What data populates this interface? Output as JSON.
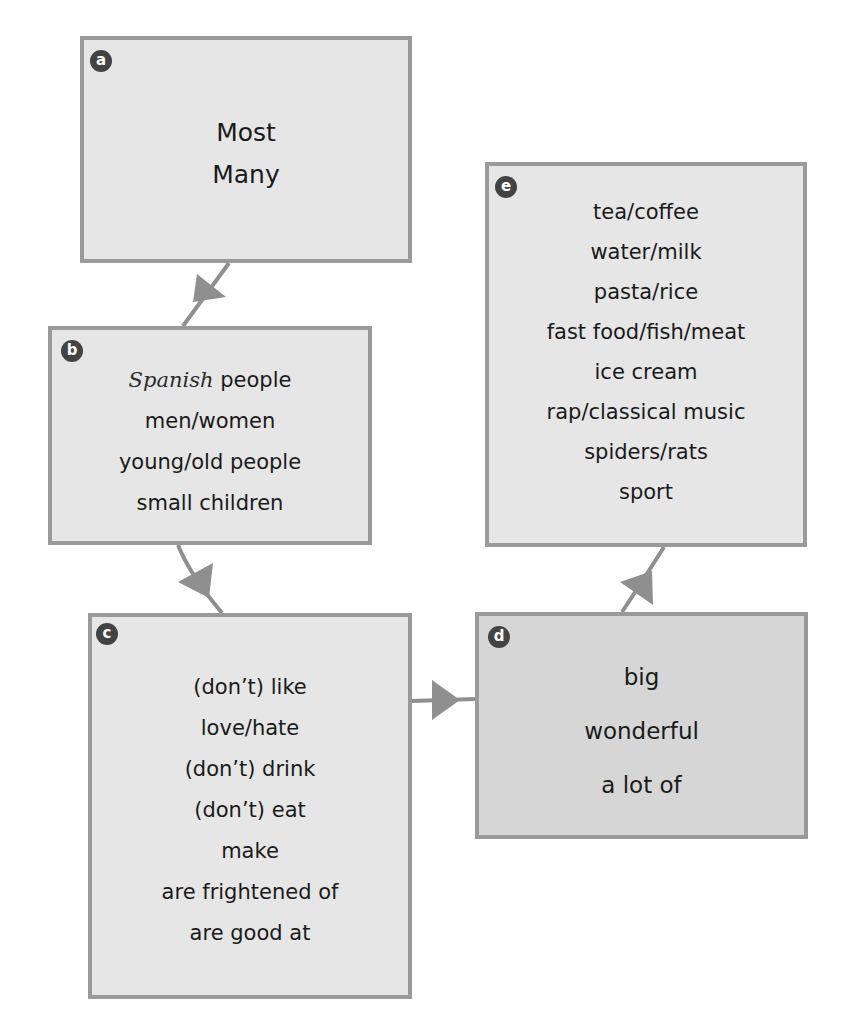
{
  "diagram": {
    "type": "flow",
    "colors": {
      "box_fill": "#e6e6e6",
      "box_fill_d": "#d6d6d6",
      "box_border": "#9a9a9a",
      "badge": "#434343",
      "arrow": "#8f8f8f"
    },
    "boxes": [
      {
        "id": "a",
        "label": "a",
        "lines": [
          "Most",
          "Many"
        ]
      },
      {
        "id": "b",
        "label": "b",
        "handwritten": "Spanish",
        "lines": [
          "people",
          "men/women",
          "young/old people",
          "small children"
        ]
      },
      {
        "id": "c",
        "label": "c",
        "lines": [
          "(don’t) like",
          "love/hate",
          "(don’t) drink",
          "(don’t) eat",
          "make",
          "are frightened of",
          "are good at"
        ]
      },
      {
        "id": "d",
        "label": "d",
        "lines": [
          "big",
          "wonderful",
          "a lot of"
        ]
      },
      {
        "id": "e",
        "label": "e",
        "lines": [
          "tea/coffee",
          "water/milk",
          "pasta/rice",
          "fast food/fish/meat",
          "ice cream",
          "rap/classical music",
          "spiders/rats",
          "sport"
        ]
      }
    ],
    "edges": [
      {
        "from": "a",
        "to": "b"
      },
      {
        "from": "b",
        "to": "c"
      },
      {
        "from": "c",
        "to": "d"
      },
      {
        "from": "d",
        "to": "e"
      }
    ]
  }
}
